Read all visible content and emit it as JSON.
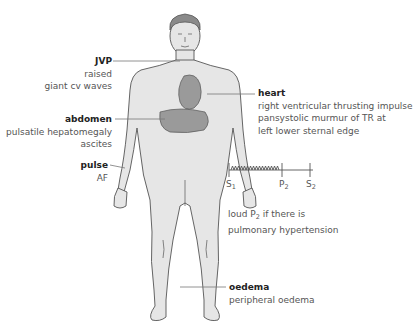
{
  "figure": {
    "colors": {
      "body_fill": "#e6e6e6",
      "body_outline": "#555555",
      "organ_fill": "#9a9a9a",
      "hair": "#8a8a8a",
      "leader_line": "#777777"
    }
  },
  "annotations": {
    "jvp": {
      "title": "JVP",
      "lines": [
        "raised",
        "giant cv waves"
      ]
    },
    "heart": {
      "title": "heart",
      "lines": [
        "right ventricular thrusting impulse",
        "pansystolic murmur of TR at",
        "left lower sternal edge"
      ]
    },
    "abdomen": {
      "title": "abdomen",
      "lines": [
        "pulsatile hepatomegaly",
        "ascites"
      ]
    },
    "pulse": {
      "title": "pulse",
      "lines": [
        "AF"
      ]
    },
    "oedema": {
      "title": "oedema",
      "lines": [
        "peripheral oedema"
      ]
    }
  },
  "heart_sound_diagram": {
    "labels": {
      "s1": "S",
      "s1_sub": "1",
      "p2": "P",
      "p2_sub": "2",
      "s2": "S",
      "s2_sub": "2"
    },
    "murmur": "pansystolic",
    "note_line1_pre": "loud P",
    "note_line1_sub": "2",
    "note_line1_post": " if there is",
    "note_line2": "pulmonary hypertension"
  }
}
